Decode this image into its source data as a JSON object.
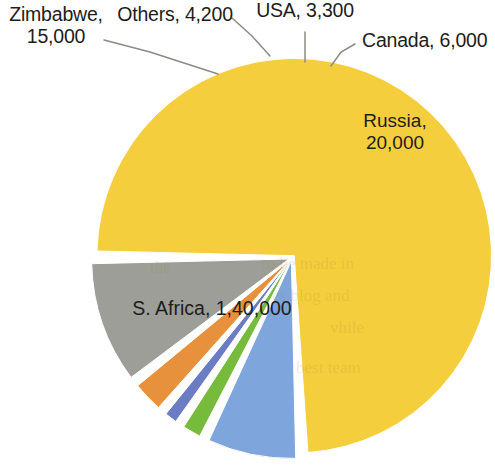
{
  "chart_data": {
    "type": "pie",
    "title": "",
    "subtitle": "",
    "xlabel": "",
    "ylabel": "",
    "legend_position": "callout-labels",
    "grid": false,
    "total": 188500,
    "categories": [
      "S. Africa",
      "Russia",
      "Zimbabwe",
      "Canada",
      "Others",
      "USA"
    ],
    "values": [
      140000,
      20000,
      15000,
      6000,
      4200,
      3300
    ],
    "value_labels": [
      "1,40,000",
      "20,000",
      "15,000",
      "6,000",
      "4,200",
      "3,300"
    ],
    "colors": [
      "#F5CE3E",
      "#9E9E99",
      "#7EA6DC",
      "#E8913C",
      "#77BB3C",
      "#6B7BC4"
    ],
    "slices": [
      {
        "name": "S. Africa",
        "label": "S. Africa, 1,40,000",
        "value": 140000,
        "value_label": "1,40,000",
        "color": "#F5CE3E",
        "label_position": "inside",
        "percent": "74.3%"
      },
      {
        "name": "Russia",
        "label": "Russia,\n20,000",
        "value": 20000,
        "value_label": "20,000",
        "color": "#9E9E99",
        "label_position": "inside",
        "percent": "10.6%"
      },
      {
        "name": "Zimbabwe",
        "label": "Zimbabwe,\n15,000",
        "value": 15000,
        "value_label": "15,000",
        "color": "#7EA6DC",
        "label_position": "outside-left",
        "percent": "8.0%"
      },
      {
        "name": "Canada",
        "label": "Canada, 6,000",
        "value": 6000,
        "value_label": "6,000",
        "color": "#E8913C",
        "label_position": "outside-right",
        "percent": "3.2%"
      },
      {
        "name": "Others",
        "label": "Others, 4,200",
        "value": 4200,
        "value_label": "4,200",
        "color": "#77BB3C",
        "label_position": "outside-top-left",
        "percent": "2.2%"
      },
      {
        "name": "USA",
        "label": "USA, 3,300",
        "value": 3300,
        "value_label": "3,300",
        "color": "#6B7BC4",
        "label_position": "outside-top",
        "percent": "1.8%"
      }
    ]
  },
  "labels": {
    "zimbabwe": "Zimbabwe,\n15,000",
    "others": "Others, 4,200",
    "usa": "USA, 3,300",
    "canada": "Canada, 6,000",
    "russia": "Russia,\n20,000",
    "safrica": "S. Africa, 1,40,000"
  },
  "style": {
    "background": "#ffffff",
    "leader_line_color": "#8b8b86",
    "slice_gap_color": "#ffffff",
    "text_color": "#1d1d1b"
  }
}
